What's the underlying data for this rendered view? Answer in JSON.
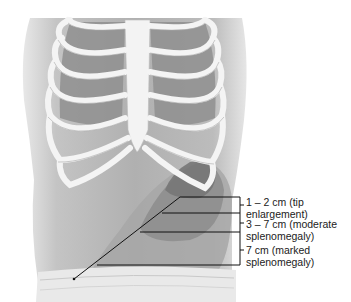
{
  "figure": {
    "labels": [
      {
        "line1": "1 – 2 cm (tip",
        "line2": "enlargement)"
      },
      {
        "line1": "3 – 7 cm (moderate",
        "line2": "splenomegaly)"
      },
      {
        "line1": "7 cm (marked",
        "line2": "splenomegaly)"
      }
    ],
    "colors": {
      "skin": "#bdbdbd",
      "skin_dark": "#8a8a8a",
      "rib": "#f2f2f2",
      "lung": "#9a9a9a",
      "zone1": "#7a7a7a",
      "zone2": "#8e8e8e",
      "zone3": "#a3a3a3",
      "leader": "#111111"
    }
  }
}
